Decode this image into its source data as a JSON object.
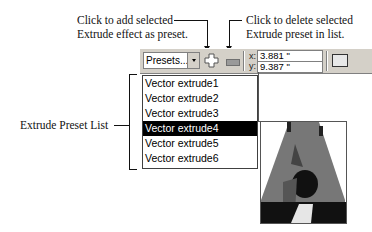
{
  "annotations": {
    "add_preset": [
      "Click to add selected",
      "Extrude effect as preset."
    ],
    "delete_preset": [
      "Click to delete selected",
      "Extrude preset in list."
    ],
    "preset_list": "Extrude Preset List"
  },
  "toolbar": {
    "presets_combo": "Presets...",
    "add_icon": "plus-icon",
    "delete_icon": "minus-icon",
    "x_label": "x:",
    "x_value": "3.881 \"",
    "y_label": "y:",
    "y_value": "9.387 \""
  },
  "preset_list": {
    "items": [
      "Vector extrude1",
      "Vector extrude2",
      "Vector extrude3",
      "Vector extrude4",
      "Vector extrude5",
      "Vector extrude6"
    ],
    "selected_index": 3
  },
  "preview": {
    "description": "3D extruded letter A"
  }
}
